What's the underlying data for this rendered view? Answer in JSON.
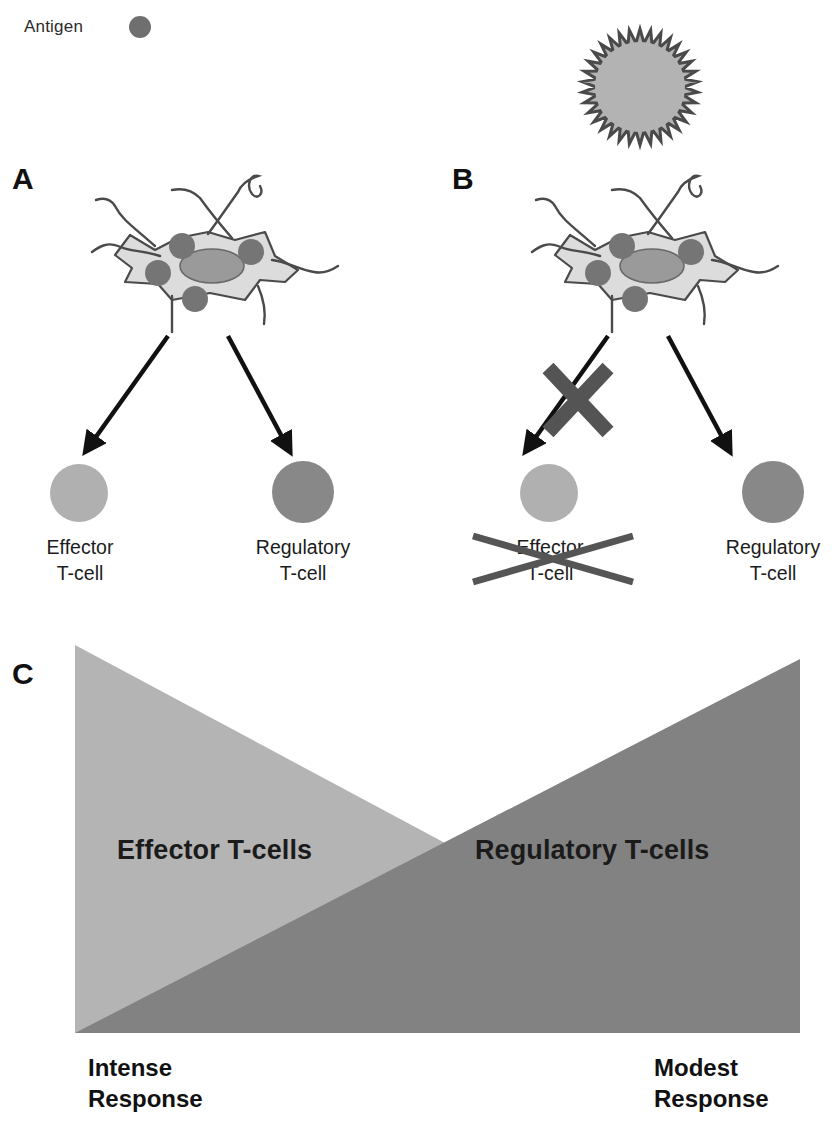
{
  "legend": {
    "label": "Antigen",
    "dot_icon": "antigen-dot-icon",
    "dot_color": "#6f6f6f"
  },
  "virus": {
    "icon": "spiky-antigen-particle-icon",
    "fill_color": "#b3b3b3",
    "spike_color": "#4a4a4a"
  },
  "panels": [
    {
      "letter": "A",
      "cell_icon": "dendritic-cell-icon",
      "left_branch": {
        "arrow_icon": "arrow-down-left-icon",
        "cell_icon": "effector-t-cell-icon",
        "cell_color": "#b0b0b0",
        "label_line1": "Effector",
        "label_line2": "T-cell",
        "blocked": false
      },
      "right_branch": {
        "arrow_icon": "arrow-down-right-icon",
        "cell_icon": "regulatory-t-cell-icon",
        "cell_color": "#888888",
        "label_line1": "Regulatory",
        "label_line2": "T-cell",
        "blocked": false
      }
    },
    {
      "letter": "B",
      "cell_icon": "dendritic-cell-icon",
      "left_branch": {
        "arrow_icon": "arrow-down-left-icon",
        "cell_icon": "effector-t-cell-icon",
        "cell_color": "#b0b0b0",
        "label_line1": "Effector",
        "label_line2": "T-cell",
        "blocked": true,
        "block_icon": "x-cross-icon",
        "block_color": "#545454"
      },
      "right_branch": {
        "arrow_icon": "arrow-down-right-icon",
        "cell_icon": "regulatory-t-cell-icon",
        "cell_color": "#888888",
        "label_line1": "Regulatory",
        "label_line2": "T-cell",
        "blocked": false
      }
    }
  ],
  "panelC": {
    "letter": "C",
    "effector_label": "Effector T-cells",
    "regulatory_label": "Regulatory T-cells",
    "effector_color": "#b4b4b4",
    "regulatory_color": "#828282",
    "left_response_line1": "Intense",
    "left_response_line2": "Response",
    "right_response_line1": "Modest",
    "right_response_line2": "Response"
  },
  "chart_data": {
    "type": "area",
    "title": "",
    "xlabel": "",
    "ylabel": "",
    "x": [
      "left",
      "right"
    ],
    "series": [
      {
        "name": "Effector T-cells",
        "values": [
          100,
          0
        ],
        "color": "#b4b4b4"
      },
      {
        "name": "Regulatory T-cells",
        "values": [
          0,
          100
        ],
        "color": "#828282"
      }
    ],
    "annotations": [
      "Intense Response",
      "Modest Response"
    ],
    "legend": "inline"
  }
}
